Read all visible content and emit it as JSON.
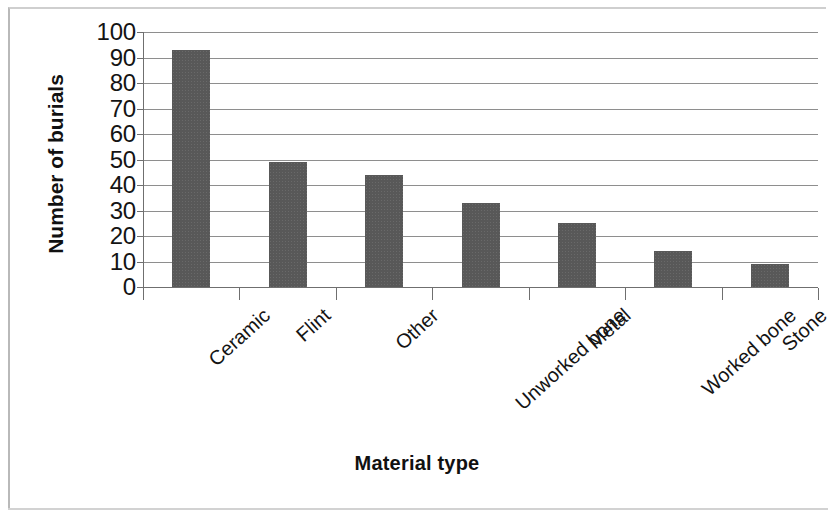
{
  "chart_data": {
    "type": "bar",
    "title": "",
    "xlabel": "Material type",
    "ylabel": "Number of burials",
    "categories": [
      "Ceramic",
      "Flint",
      "Other",
      "Unworked bone",
      "Metal",
      "Worked bone",
      "Stone"
    ],
    "values": [
      93,
      49,
      44,
      33,
      25,
      14,
      9
    ],
    "ylim": [
      0,
      100
    ],
    "ytick_labels": [
      "100",
      "90",
      "80",
      "70",
      "60",
      "50",
      "40",
      "30",
      "20",
      "10",
      "0"
    ],
    "ytick_values": [
      100,
      90,
      80,
      70,
      60,
      50,
      40,
      30,
      20,
      10,
      0
    ],
    "grid": true,
    "legend": false,
    "bar_color": "#585858",
    "gridline_color": "#8e8e8e",
    "axis_color": "#6f6f6f",
    "background_color": "#ffffff",
    "label_rotation_deg": -42
  },
  "figure": {
    "frame_color": "#c4c4c4"
  }
}
